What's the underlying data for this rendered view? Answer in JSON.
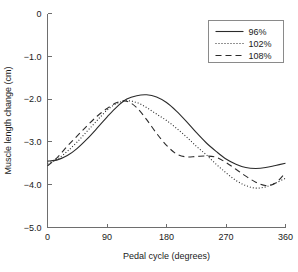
{
  "chart_data": {
    "type": "line",
    "title": "",
    "xlabel": "Pedal cycle (degrees)",
    "ylabel": "Muscle length change (cm)",
    "xlim": [
      0,
      360
    ],
    "ylim": [
      -5.0,
      0
    ],
    "grid": false,
    "legend_position": "top-right",
    "xticks": [
      "0",
      "90",
      "180",
      "270",
      "360"
    ],
    "xtick_values": [
      0,
      90,
      180,
      270,
      360
    ],
    "yticks": [
      "0",
      "−1.0",
      "−2.0",
      "−3.0",
      "−4.0",
      "−5.0"
    ],
    "ytick_values": [
      0,
      -1.0,
      -2.0,
      -3.0,
      -4.0,
      -5.0
    ],
    "x": [
      0,
      15,
      30,
      45,
      60,
      75,
      90,
      105,
      120,
      135,
      150,
      165,
      180,
      195,
      210,
      225,
      240,
      255,
      270,
      285,
      300,
      315,
      330,
      345,
      360
    ],
    "series": [
      {
        "name": "96%",
        "style": "solid",
        "values": [
          -3.45,
          -3.42,
          -3.32,
          -3.15,
          -2.93,
          -2.68,
          -2.42,
          -2.18,
          -2.0,
          -1.92,
          -1.9,
          -1.95,
          -2.08,
          -2.28,
          -2.52,
          -2.78,
          -3.02,
          -3.22,
          -3.4,
          -3.52,
          -3.6,
          -3.62,
          -3.6,
          -3.55,
          -3.5
        ]
      },
      {
        "name": "102%",
        "style": "dotted",
        "values": [
          -3.5,
          -3.4,
          -3.22,
          -3.0,
          -2.75,
          -2.5,
          -2.26,
          -2.1,
          -2.04,
          -2.08,
          -2.2,
          -2.35,
          -2.5,
          -2.68,
          -2.88,
          -3.1,
          -3.3,
          -3.52,
          -3.72,
          -3.9,
          -4.02,
          -4.08,
          -4.05,
          -3.96,
          -3.85
        ]
      },
      {
        "name": "108%",
        "style": "dashed",
        "values": [
          -3.56,
          -3.36,
          -3.1,
          -2.86,
          -2.62,
          -2.4,
          -2.22,
          -2.08,
          -2.05,
          -2.2,
          -2.48,
          -2.8,
          -3.08,
          -3.28,
          -3.35,
          -3.34,
          -3.33,
          -3.36,
          -3.48,
          -3.64,
          -3.8,
          -3.94,
          -4.02,
          -3.96,
          -3.72
        ]
      }
    ]
  },
  "legend": {
    "items": [
      {
        "label": "96%",
        "style": "solid"
      },
      {
        "label": "102%",
        "style": "dotted"
      },
      {
        "label": "108%",
        "style": "dashed"
      }
    ]
  },
  "colors": {
    "line": "#2b2b2b",
    "axis": "#6e6e6e",
    "text": "#1a1a1a",
    "background": "#ffffff",
    "legend_border": "#8a8a8a"
  }
}
